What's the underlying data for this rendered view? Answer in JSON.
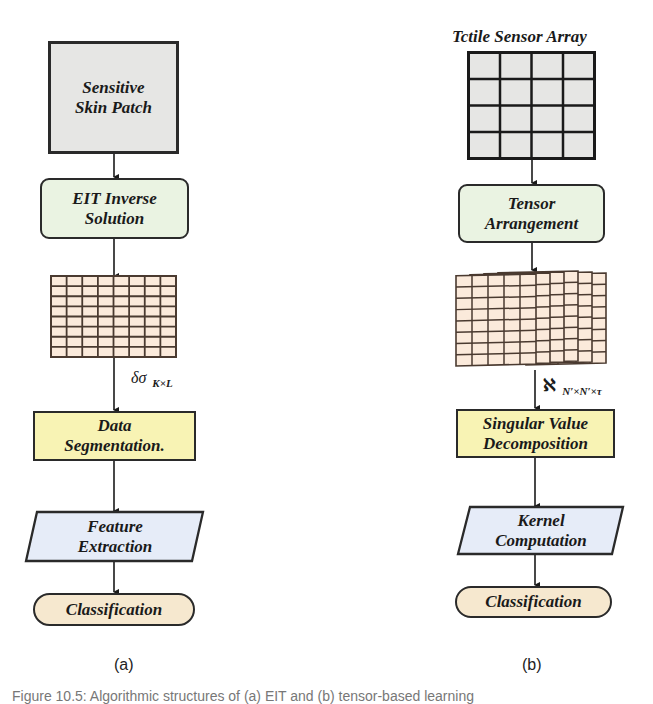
{
  "panel_a": {
    "label": "(a)",
    "nodes": {
      "skin_patch": "Sensitive\nSkin Patch",
      "eit_inverse": "EIT Inverse\nSolution",
      "data_segmentation": "Data\nSegmentation.",
      "feature_extraction": "Feature\nExtraction",
      "classification": "Classification"
    },
    "grid": {
      "rows": 8,
      "cols": 8,
      "fill": "#fbeadb",
      "stroke": "#4a3a30"
    },
    "edge_label": {
      "symbol": "δσ",
      "subscript": "K×L"
    }
  },
  "panel_b": {
    "label": "(b)",
    "title": "Tctile Sensor Array",
    "sensor_grid": {
      "rows": 4,
      "cols": 4,
      "fill": "#e6e6e4",
      "stroke": "#1a1a1a"
    },
    "nodes": {
      "tensor_arrangement": "Tensor\nArrangement",
      "svd": "Singular Value\nDecomposition",
      "kernel_computation": "Kernel\nComputation",
      "classification": "Classification"
    },
    "tensor_stack": {
      "sheets": 6,
      "rows": 8,
      "cols": 5,
      "fill": "#fbeadb",
      "stroke": "#4a3a30"
    },
    "edge_label": {
      "symbol": "ℵ",
      "subscript": "N′×N′×τ"
    }
  },
  "caption": "Figure 10.5: Algorithmic structures of (a) EIT and (b) tensor-based learning",
  "colors": {
    "gray_box": "#e6e6e4",
    "green_box": "#eaf3e2",
    "yellow_box": "#f8f3b4",
    "blue_box": "#e6ecf8",
    "oval": "#f6e8cf",
    "stroke": "#2a2a2a"
  }
}
